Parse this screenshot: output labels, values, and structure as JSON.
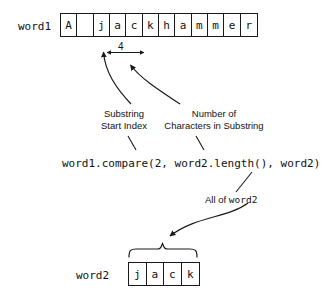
{
  "diagram": {
    "word1": {
      "label": "word1",
      "cells": [
        "A",
        " ",
        "j",
        "a",
        "c",
        "k",
        "h",
        "a",
        "m",
        "m",
        "e",
        "r"
      ]
    },
    "word2": {
      "label": "word2",
      "cells": [
        "j",
        "a",
        "c",
        "k"
      ]
    },
    "dimension": {
      "value": "4"
    },
    "annotations": {
      "substring_start_index": "Substring\nStart Index",
      "substring_start_index_line1": "Substring",
      "substring_start_index_line2": "Start Index",
      "number_of_characters": "Number of\nCharacters in Substring",
      "number_of_characters_line1": "Number of",
      "number_of_characters_line2": "Characters in Substring",
      "all_of_word2_prefix": "All of ",
      "all_of_word2_mono": "word2"
    },
    "code": {
      "line": "word1.compare(2, word2.length(), word2)"
    },
    "colors": {
      "ink": "#1a1a1a",
      "background": "#ffffff"
    }
  }
}
